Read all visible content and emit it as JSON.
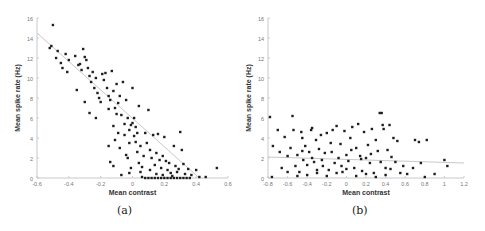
{
  "chart_data": [
    {
      "type": "scatter",
      "panel_label": "(a)",
      "xlabel": "Mean contrast",
      "ylabel": "Mean spike rate (Hz)",
      "xlim": [
        -0.6,
        0.6
      ],
      "ylim": [
        0,
        16
      ],
      "xticks": [
        -0.6,
        -0.4,
        -0.2,
        0,
        0.2,
        0.4,
        0.6
      ],
      "yticks": [
        0,
        2,
        4,
        6,
        8,
        10,
        12,
        14,
        16
      ],
      "fit_line": {
        "x": [
          -0.6,
          0.42
        ],
        "y": [
          14.5,
          0
        ]
      },
      "points": [
        [
          -0.5,
          15.3
        ],
        [
          -0.52,
          13.0
        ],
        [
          -0.51,
          13.2
        ],
        [
          -0.47,
          12.7
        ],
        [
          -0.48,
          12.0
        ],
        [
          -0.45,
          11.5
        ],
        [
          -0.44,
          11.0
        ],
        [
          -0.42,
          12.4
        ],
        [
          -0.4,
          11.8
        ],
        [
          -0.41,
          10.6
        ],
        [
          -0.36,
          12.2
        ],
        [
          -0.34,
          11.3
        ],
        [
          -0.33,
          11.4
        ],
        [
          -0.31,
          12.9
        ],
        [
          -0.3,
          12.1
        ],
        [
          -0.29,
          11.8
        ],
        [
          -0.28,
          11.0
        ],
        [
          -0.32,
          10.8
        ],
        [
          -0.35,
          8.8
        ],
        [
          -0.3,
          7.6
        ],
        [
          -0.27,
          10.2
        ],
        [
          -0.26,
          9.6
        ],
        [
          -0.25,
          10.6
        ],
        [
          -0.24,
          9.0
        ],
        [
          -0.23,
          10.0
        ],
        [
          -0.22,
          8.5
        ],
        [
          -0.21,
          8.0
        ],
        [
          -0.2,
          7.6
        ],
        [
          -0.19,
          10.4
        ],
        [
          -0.18,
          9.8
        ],
        [
          -0.17,
          10.5
        ],
        [
          -0.16,
          9.0
        ],
        [
          -0.15,
          8.2
        ],
        [
          -0.14,
          7.8
        ],
        [
          -0.13,
          10.7
        ],
        [
          -0.12,
          8.7
        ],
        [
          -0.11,
          7.0
        ],
        [
          -0.1,
          9.4
        ],
        [
          -0.09,
          7.5
        ],
        [
          -0.08,
          8.2
        ],
        [
          -0.27,
          6.5
        ],
        [
          -0.23,
          6.0
        ],
        [
          -0.15,
          6.9
        ],
        [
          -0.12,
          5.2
        ],
        [
          -0.1,
          6.4
        ],
        [
          -0.07,
          6.3
        ],
        [
          -0.06,
          9.6
        ],
        [
          -0.05,
          5.4
        ],
        [
          -0.04,
          7.8
        ],
        [
          -0.03,
          6.0
        ],
        [
          -0.02,
          4.8
        ],
        [
          -0.01,
          5.3
        ],
        [
          0.0,
          5.5
        ],
        [
          0.01,
          4.2
        ],
        [
          0.02,
          5.1
        ],
        [
          0.03,
          4.5
        ],
        [
          0.04,
          7.2
        ],
        [
          0.0,
          9.0
        ],
        [
          0.01,
          6.0
        ],
        [
          -0.09,
          4.5
        ],
        [
          -0.11,
          3.8
        ],
        [
          -0.15,
          3.2
        ],
        [
          -0.14,
          1.6
        ],
        [
          -0.12,
          1.2
        ],
        [
          -0.08,
          3.0
        ],
        [
          -0.05,
          4.3
        ],
        [
          -0.04,
          2.3
        ],
        [
          -0.03,
          2.0
        ],
        [
          -0.02,
          3.5
        ],
        [
          -0.01,
          1.0
        ],
        [
          0.02,
          3.6
        ],
        [
          0.03,
          2.6
        ],
        [
          0.04,
          1.5
        ],
        [
          0.05,
          3.2
        ],
        [
          0.06,
          1.1
        ],
        [
          0.07,
          2.2
        ],
        [
          0.08,
          4.5
        ],
        [
          0.09,
          3.5
        ],
        [
          0.1,
          6.8
        ],
        [
          0.11,
          2.8
        ],
        [
          0.12,
          2.0
        ],
        [
          0.13,
          4.3
        ],
        [
          0.14,
          1.3
        ],
        [
          0.15,
          2.5
        ],
        [
          0.16,
          4.4
        ],
        [
          0.17,
          1.8
        ],
        [
          0.18,
          1.0
        ],
        [
          0.19,
          2.2
        ],
        [
          0.2,
          4.1
        ],
        [
          0.21,
          1.7
        ],
        [
          0.22,
          0.8
        ],
        [
          0.23,
          1.5
        ],
        [
          0.24,
          0.5
        ],
        [
          0.26,
          3.2
        ],
        [
          0.27,
          1.2
        ],
        [
          0.28,
          0.6
        ],
        [
          0.3,
          4.6
        ],
        [
          0.31,
          2.8
        ],
        [
          0.32,
          1.4
        ],
        [
          0.33,
          0.4
        ],
        [
          0.35,
          0.9
        ],
        [
          0.37,
          0.3
        ],
        [
          0.4,
          0.8
        ],
        [
          0.42,
          0.1
        ],
        [
          0.46,
          0.1
        ],
        [
          0.53,
          1.0
        ],
        [
          -0.07,
          0.3
        ],
        [
          -0.02,
          0.5
        ],
        [
          0.06,
          0.1
        ],
        [
          0.08,
          0.0
        ],
        [
          0.1,
          0.0
        ],
        [
          0.12,
          0.0
        ],
        [
          0.14,
          0.0
        ],
        [
          0.16,
          0.0
        ],
        [
          0.18,
          0.0
        ],
        [
          0.2,
          0.0
        ],
        [
          0.22,
          0.0
        ],
        [
          0.24,
          0.0
        ],
        [
          0.26,
          0.0
        ],
        [
          0.28,
          0.0
        ],
        [
          0.3,
          0.0
        ],
        [
          0.32,
          0.0
        ],
        [
          0.34,
          0.0
        ],
        [
          0.36,
          0.0
        ],
        [
          0.05,
          0.6
        ],
        [
          0.11,
          0.8
        ],
        [
          0.15,
          0.4
        ],
        [
          0.19,
          0.3
        ],
        [
          0.25,
          0.2
        ],
        [
          0.29,
          0.9
        ]
      ]
    },
    {
      "type": "scatter",
      "panel_label": "(b)",
      "xlabel": "Mean contrast",
      "ylabel": "Mean spike rate (Hz)",
      "xlim": [
        -0.8,
        1.2
      ],
      "ylim": [
        0,
        16
      ],
      "xticks": [
        -0.8,
        -0.6,
        -0.4,
        -0.2,
        0,
        0.2,
        0.4,
        0.6,
        0.8,
        1,
        1.2
      ],
      "yticks": [
        0,
        2,
        4,
        6,
        8,
        10,
        12,
        14,
        16
      ],
      "fit_line": {
        "x": [
          -0.8,
          1.2
        ],
        "y": [
          2.1,
          1.5
        ]
      },
      "points": [
        [
          -0.78,
          6.1
        ],
        [
          -0.75,
          3.2
        ],
        [
          -0.76,
          0.1
        ],
        [
          -0.7,
          4.8
        ],
        [
          -0.68,
          2.6
        ],
        [
          -0.66,
          1.0
        ],
        [
          -0.63,
          4.1
        ],
        [
          -0.6,
          2.2
        ],
        [
          -0.57,
          3.0
        ],
        [
          -0.55,
          6.2
        ],
        [
          -0.54,
          4.8
        ],
        [
          -0.52,
          1.2
        ],
        [
          -0.5,
          2.3
        ],
        [
          -0.48,
          0.6
        ],
        [
          -0.46,
          4.6
        ],
        [
          -0.45,
          4.0
        ],
        [
          -0.44,
          1.8
        ],
        [
          -0.42,
          3.2
        ],
        [
          -0.4,
          1.3
        ],
        [
          -0.38,
          2.6
        ],
        [
          -0.36,
          4.8
        ],
        [
          -0.35,
          5.0
        ],
        [
          -0.33,
          1.6
        ],
        [
          -0.31,
          3.8
        ],
        [
          -0.3,
          0.5
        ],
        [
          -0.28,
          2.9
        ],
        [
          -0.26,
          4.3
        ],
        [
          -0.24,
          1.2
        ],
        [
          -0.22,
          2.5
        ],
        [
          -0.2,
          4.5
        ],
        [
          -0.18,
          0.8
        ],
        [
          -0.16,
          3.5
        ],
        [
          -0.14,
          4.8
        ],
        [
          -0.12,
          1.5
        ],
        [
          -0.1,
          5.2
        ],
        [
          -0.08,
          2.0
        ],
        [
          -0.06,
          3.4
        ],
        [
          -0.04,
          0.6
        ],
        [
          -0.02,
          4.7
        ],
        [
          0.0,
          2.3
        ],
        [
          0.02,
          1.7
        ],
        [
          0.04,
          4.0
        ],
        [
          0.06,
          5.1
        ],
        [
          0.08,
          1.0
        ],
        [
          0.1,
          3.0
        ],
        [
          0.12,
          5.4
        ],
        [
          0.14,
          2.2
        ],
        [
          0.16,
          0.7
        ],
        [
          0.18,
          4.6
        ],
        [
          0.2,
          2.0
        ],
        [
          0.22,
          3.3
        ],
        [
          0.24,
          1.5
        ],
        [
          0.26,
          4.9
        ],
        [
          0.28,
          0.5
        ],
        [
          0.3,
          3.8
        ],
        [
          0.32,
          2.7
        ],
        [
          0.34,
          6.5
        ],
        [
          0.36,
          6.5
        ],
        [
          0.37,
          5.3
        ],
        [
          0.38,
          4.9
        ],
        [
          0.4,
          1.0
        ],
        [
          0.42,
          2.8
        ],
        [
          0.44,
          5.3
        ],
        [
          0.46,
          2.1
        ],
        [
          0.48,
          4.0
        ],
        [
          0.5,
          1.6
        ],
        [
          0.52,
          3.7
        ],
        [
          0.55,
          0.5
        ],
        [
          0.58,
          1.2
        ],
        [
          0.62,
          0.4
        ],
        [
          0.68,
          1.0
        ],
        [
          0.7,
          3.8
        ],
        [
          0.74,
          3.6
        ],
        [
          0.76,
          1.5
        ],
        [
          0.82,
          3.8
        ],
        [
          0.8,
          0.1
        ],
        [
          0.9,
          0.4
        ],
        [
          1.0,
          1.8
        ],
        [
          1.03,
          1.2
        ],
        [
          -0.5,
          0.2
        ],
        [
          -0.4,
          0.3
        ],
        [
          -0.3,
          0.8
        ],
        [
          -0.2,
          0.2
        ],
        [
          -0.1,
          0.5
        ],
        [
          0.0,
          0.9
        ],
        [
          0.1,
          0.2
        ],
        [
          0.2,
          0.4
        ],
        [
          0.3,
          0.1
        ],
        [
          0.4,
          0.3
        ],
        [
          -0.6,
          0.6
        ],
        [
          -0.35,
          2.0
        ],
        [
          -0.25,
          1.8
        ],
        [
          -0.15,
          2.6
        ],
        [
          -0.05,
          1.2
        ],
        [
          0.05,
          2.8
        ],
        [
          0.15,
          1.9
        ],
        [
          0.25,
          2.4
        ],
        [
          0.35,
          1.6
        ],
        [
          0.45,
          0.9
        ],
        [
          -0.45,
          2.7
        ]
      ]
    }
  ]
}
